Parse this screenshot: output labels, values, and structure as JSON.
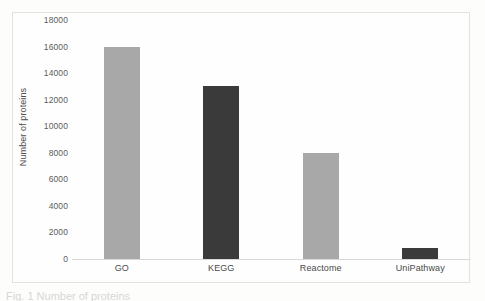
{
  "chart_data": {
    "type": "bar",
    "title": "",
    "subtitle": "",
    "xlabel": "",
    "ylabel": "Number of proteins",
    "categories": [
      "GO",
      "KEGG",
      "Reactome",
      "UniPathway"
    ],
    "values": [
      16000,
      13000,
      8000,
      800
    ],
    "bar_colors": [
      "#a8a8a8",
      "#3a3a3a",
      "#a8a8a8",
      "#3a3a3a"
    ],
    "ylim": [
      0,
      18000
    ],
    "ytick_values": [
      18000,
      16000,
      14000,
      12000,
      10000,
      8000,
      6000,
      4000,
      2000,
      0
    ],
    "ytick_labels": [
      "18000",
      "16000",
      "14000",
      "12000",
      "10000",
      "8000",
      "6000",
      "4000",
      "2000",
      "0"
    ],
    "grid": false,
    "legend": "none",
    "axis_line_color": "#d8d8d6",
    "frame_color": "#e2e2e0",
    "background_color": "#fefefe",
    "tick_label_color": "#5d5d5d",
    "axis_title_color": "#4a4a4a"
  },
  "caption": {
    "text": "Fig. 1  Number of proteins"
  }
}
